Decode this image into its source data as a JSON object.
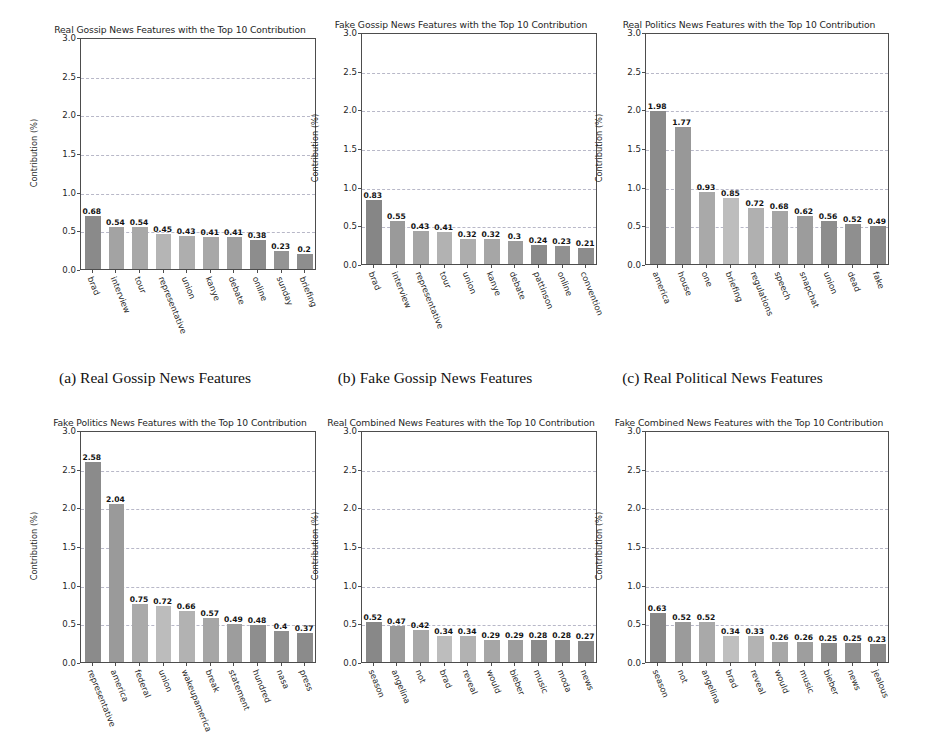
{
  "figure": {
    "ylabel": "Contribution (%)",
    "yticks": [
      "0.0",
      "0.5",
      "1.0",
      "1.5",
      "2.0",
      "2.5",
      "3.0"
    ],
    "ylim": [
      0,
      3.0
    ]
  },
  "captions": [
    "(a) Real Gossip News Features",
    "(b) Fake Gossip News Features",
    "(c) Real Political News Features"
  ],
  "chart_data": [
    {
      "id": "a",
      "type": "bar",
      "title": "Real Gossip News Features with the Top 10 Contribution",
      "ylabel": "Contribution (%)",
      "xlabel": "",
      "ylim": [
        0,
        3.0
      ],
      "yticks": [
        0.0,
        0.5,
        1.0,
        1.5,
        2.0,
        2.5,
        3.0
      ],
      "grid": true,
      "categories": [
        "brad",
        "interview",
        "tour",
        "representative",
        "union",
        "kanye",
        "debate",
        "online",
        "sunday",
        "briefing"
      ],
      "values": [
        0.68,
        0.54,
        0.54,
        0.45,
        0.43,
        0.41,
        0.41,
        0.38,
        0.23,
        0.2
      ],
      "labels": [
        "0.68",
        "0.54",
        "0.54",
        "0.45",
        "0.43",
        "0.41",
        "0.41",
        "0.38",
        "0.23",
        "0.2"
      ],
      "bar_colors": [
        "#8a8a8a",
        "#a3a3a3",
        "#a8a8a8",
        "#b5b5b5",
        "#aeaeae",
        "#a8a8a8",
        "#a0a0a0",
        "#8d8d8d",
        "#949494",
        "#8e8e8e"
      ]
    },
    {
      "id": "b",
      "type": "bar",
      "title": "Fake Gossip News Features with the Top 10 Contribution",
      "ylabel": "Contribution (%)",
      "xlabel": "",
      "ylim": [
        0,
        3.0
      ],
      "yticks": [
        0.0,
        0.5,
        1.0,
        1.5,
        2.0,
        2.5,
        3.0
      ],
      "grid": true,
      "categories": [
        "brad",
        "interview",
        "representative",
        "tour",
        "union",
        "kanye",
        "debate",
        "pattinson",
        "online",
        "convention"
      ],
      "values": [
        0.83,
        0.55,
        0.43,
        0.41,
        0.32,
        0.32,
        0.3,
        0.24,
        0.23,
        0.21
      ],
      "labels": [
        "0.83",
        "0.55",
        "0.43",
        "0.41",
        "0.32",
        "0.32",
        "0.3",
        "0.24",
        "0.23",
        "0.21"
      ],
      "bar_colors": [
        "#868686",
        "#9a9a9a",
        "#a5a5a5",
        "#b2b2b2",
        "#adadad",
        "#a6a6a6",
        "#9d9d9d",
        "#8b8b8b",
        "#919191",
        "#8c8c8c"
      ]
    },
    {
      "id": "c",
      "type": "bar",
      "title": "Real Politics News Features with the Top 10 Contribution",
      "ylabel": "Contribution (%)",
      "xlabel": "",
      "ylim": [
        0,
        3.0
      ],
      "yticks": [
        0.0,
        0.5,
        1.0,
        1.5,
        2.0,
        2.5,
        3.0
      ],
      "grid": true,
      "categories": [
        "america",
        "house",
        "one",
        "briefing",
        "regulations",
        "speech",
        "snapchat",
        "union",
        "dead",
        "fake"
      ],
      "values": [
        1.98,
        1.77,
        0.93,
        0.85,
        0.72,
        0.68,
        0.62,
        0.56,
        0.52,
        0.49
      ],
      "labels": [
        "1.98",
        "1.77",
        "0.93",
        "0.85",
        "0.72",
        "0.68",
        "0.62",
        "0.56",
        "0.52",
        "0.49"
      ],
      "bar_colors": [
        "#8b8b8b",
        "#989898",
        "#a9a9a9",
        "#bdbdbd",
        "#b0b0b0",
        "#a5a5a5",
        "#9c9c9c",
        "#8d8d8d",
        "#8f8f8f",
        "#8a8a8a"
      ]
    },
    {
      "id": "d",
      "type": "bar",
      "title": "Fake Politics News Features with the Top 10 Contribution",
      "ylabel": "Contribution (%)",
      "xlabel": "",
      "ylim": [
        0,
        3.0
      ],
      "yticks": [
        0.0,
        0.5,
        1.0,
        1.5,
        2.0,
        2.5,
        3.0
      ],
      "grid": true,
      "categories": [
        "representative",
        "america",
        "federal",
        "union",
        "wakeupamerica",
        "break",
        "statement",
        "hundred",
        "nasa",
        "press"
      ],
      "values": [
        2.58,
        2.04,
        0.75,
        0.72,
        0.66,
        0.57,
        0.49,
        0.48,
        0.4,
        0.37
      ],
      "labels": [
        "2.58",
        "2.04",
        "0.75",
        "0.72",
        "0.66",
        "0.57",
        "0.49",
        "0.48",
        "0.4",
        "0.37"
      ],
      "bar_colors": [
        "#8b8b8b",
        "#9a9a9a",
        "#aaaaaa",
        "#bcbcbc",
        "#b2b2b2",
        "#a6a6a6",
        "#9d9d9d",
        "#8e8e8e",
        "#909090",
        "#8b8b8b"
      ]
    },
    {
      "id": "e",
      "type": "bar",
      "title": "Real Combined News Features with the Top 10 Contribution",
      "ylabel": "Contribution (%)",
      "xlabel": "",
      "ylim": [
        0,
        3.0
      ],
      "yticks": [
        0.0,
        0.5,
        1.0,
        1.5,
        2.0,
        2.5,
        3.0
      ],
      "grid": true,
      "categories": [
        "season",
        "angelina",
        "not",
        "brad",
        "reveal",
        "would",
        "bieber",
        "music",
        "moda",
        "news"
      ],
      "values": [
        0.52,
        0.47,
        0.42,
        0.34,
        0.34,
        0.29,
        0.29,
        0.28,
        0.28,
        0.27
      ],
      "labels": [
        "0.52",
        "0.47",
        "0.42",
        "0.34",
        "0.34",
        "0.29",
        "0.29",
        "0.28",
        "0.28",
        "0.27"
      ],
      "bar_colors": [
        "#888888",
        "#9a9a9a",
        "#a8a8a8",
        "#bdbdbd",
        "#b2b2b2",
        "#a6a6a6",
        "#9d9d9d",
        "#8b8b8b",
        "#8e8e8e",
        "#898989"
      ]
    },
    {
      "id": "f",
      "type": "bar",
      "title": "Fake Combined News Features with the Top 10 Contribution",
      "ylabel": "Contribution (%)",
      "xlabel": "",
      "ylim": [
        0,
        3.0
      ],
      "yticks": [
        0.0,
        0.5,
        1.0,
        1.5,
        2.0,
        2.5,
        3.0
      ],
      "grid": true,
      "categories": [
        "season",
        "not",
        "angelina",
        "brad",
        "reveal",
        "would",
        "music",
        "bieber",
        "news",
        "jealous"
      ],
      "values": [
        0.63,
        0.52,
        0.52,
        0.34,
        0.33,
        0.26,
        0.26,
        0.25,
        0.25,
        0.23
      ],
      "labels": [
        "0.63",
        "0.52",
        "0.52",
        "0.34",
        "0.33",
        "0.26",
        "0.26",
        "0.25",
        "0.25",
        "0.23"
      ],
      "bar_colors": [
        "#888888",
        "#9b9b9b",
        "#a9a9a9",
        "#bfbfbf",
        "#b3b3b3",
        "#a7a7a7",
        "#9e9e9e",
        "#8c8c8c",
        "#8f8f8f",
        "#8a8a8a"
      ]
    }
  ]
}
